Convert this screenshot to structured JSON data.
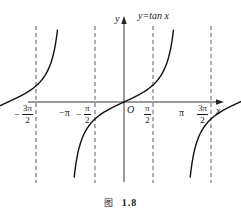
{
  "chart_data": {
    "type": "line",
    "title": "y=tan x",
    "function": "tan x",
    "xlabel": "x",
    "ylabel": "y",
    "origin_label": "O",
    "x_tick_labels": [
      "-3π/2",
      "-π",
      "-π/2",
      "π/2",
      "π",
      "3π/2"
    ],
    "x_ticks_value": [
      -4.712,
      -3.1416,
      -1.5708,
      1.5708,
      3.1416,
      4.712
    ],
    "asymptotes": [
      "-3π/2",
      "-π/2",
      "π/2",
      "3π/2"
    ],
    "xlim": [
      -4.9,
      4.9
    ],
    "ylim": [
      -3.5,
      3.5
    ],
    "grid": false,
    "legend": "none",
    "branches": [
      {
        "center": "-π",
        "domain": [
          "-3π/2",
          "-π/2"
        ]
      },
      {
        "center": "0",
        "domain": [
          "-π/2",
          "π/2"
        ]
      },
      {
        "center": "π",
        "domain": [
          "π/2",
          "3π/2"
        ]
      }
    ]
  },
  "labels": {
    "y_axis": "y",
    "x_axis": "x",
    "origin": "O",
    "function_label": "y=tan x",
    "neg_3pi_2": {
      "sign": "−",
      "num": "3π",
      "den": "2"
    },
    "neg_pi": "−π",
    "neg_pi_2": {
      "sign": "−",
      "num": "π",
      "den": "2"
    },
    "pi_2": {
      "num": "π",
      "den": "2"
    },
    "pi": "π",
    "three_pi_2": {
      "num": "3π",
      "den": "2"
    }
  },
  "caption": {
    "figure_word": "图",
    "number": "1.8"
  }
}
